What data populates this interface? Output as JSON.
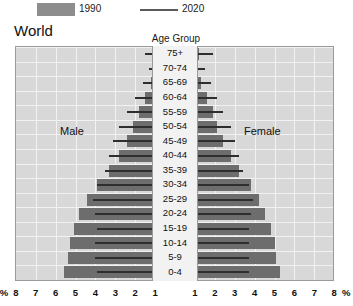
{
  "legend": {
    "items": [
      {
        "label": "1990",
        "type": "swatch",
        "color": "#8d8d8d"
      },
      {
        "label": "2020",
        "type": "line",
        "color": "#5a5a5a"
      }
    ],
    "label_1990": "1990",
    "label_2020": "2020"
  },
  "title": "World",
  "center_header": "Age Group",
  "side_labels": {
    "left": "Male",
    "right": "Female"
  },
  "axis": {
    "unit_symbol": "%",
    "left_ticks": [
      "%",
      "8",
      "7",
      "6",
      "5",
      "4",
      "3",
      "2",
      "1"
    ],
    "right_ticks": [
      "1",
      "2",
      "3",
      "4",
      "5",
      "6",
      "7",
      "8",
      "%"
    ],
    "max": 8,
    "min": 0
  },
  "chart_data": {
    "type": "bar",
    "subtype": "population-pyramid",
    "title": "World",
    "xlabel": "%",
    "ylabel": "Age Group",
    "xlim": [
      -8,
      8
    ],
    "grid": true,
    "legend_position": "top",
    "categories": [
      "75+",
      "70-74",
      "65-69",
      "60-64",
      "55-59",
      "50-54",
      "45-49",
      "40-44",
      "35-39",
      "30-34",
      "25-29",
      "20-24",
      "15-19",
      "10-14",
      "5-9",
      "0-4"
    ],
    "series": [
      {
        "name": "1990",
        "style": "bar",
        "color": "#6d6d6d",
        "male": [
          1.0,
          0.9,
          1.2,
          1.5,
          1.8,
          2.1,
          2.4,
          2.8,
          3.3,
          3.9,
          4.4,
          4.8,
          5.1,
          5.3,
          5.4,
          5.6
        ],
        "female": [
          1.2,
          1.0,
          1.3,
          1.6,
          1.9,
          2.1,
          2.4,
          2.8,
          3.2,
          3.8,
          4.2,
          4.5,
          4.8,
          5.0,
          5.1,
          5.3
        ]
      },
      {
        "name": "2020",
        "style": "line",
        "color": "#2e2e2e",
        "male": [
          1.5,
          1.3,
          1.6,
          2.0,
          2.4,
          2.8,
          3.1,
          3.3,
          3.5,
          3.9,
          4.1,
          4.0,
          3.9,
          4.0,
          4.0,
          3.9
        ],
        "female": [
          1.9,
          1.5,
          1.8,
          2.1,
          2.4,
          2.8,
          3.0,
          3.2,
          3.4,
          3.7,
          3.9,
          3.8,
          3.7,
          3.7,
          3.7,
          3.7
        ]
      }
    ]
  }
}
